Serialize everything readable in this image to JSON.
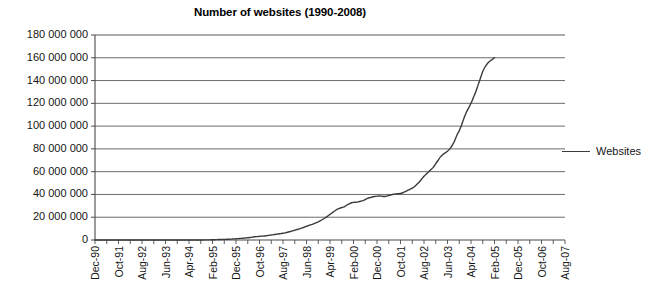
{
  "chart": {
    "title": "Number of websites (1990-2008)",
    "legend_label": "Websites",
    "legend_position": "right"
  },
  "chart_data": {
    "type": "line",
    "title": "Number of websites (1990-2008)",
    "xlabel": "",
    "ylabel": "",
    "ylim": [
      0,
      180000000
    ],
    "ytick_values": [
      0,
      20000000,
      40000000,
      60000000,
      80000000,
      100000000,
      120000000,
      140000000,
      160000000,
      180000000
    ],
    "ytick_labels": [
      "0",
      "20 000 000",
      "40 000 000",
      "60 000 000",
      "80 000 000",
      "100 000 000",
      "120 000 000",
      "140 000 000",
      "160 000 000",
      "180 000 000"
    ],
    "grid": true,
    "xtick_labels": [
      "Dec-90",
      "Oct-91",
      "Aug-92",
      "Jun-93",
      "Apr-94",
      "Feb-95",
      "Dec-95",
      "Oct-96",
      "Aug-97",
      "Jun-98",
      "Apr-99",
      "Feb-00",
      "Dec-00",
      "Oct-01",
      "Aug-02",
      "Jun-03",
      "Apr-04",
      "Feb-05",
      "Dec-05",
      "Oct-06",
      "Aug-07"
    ],
    "series": [
      {
        "name": "Websites",
        "color": "#3b3b3b",
        "x": [
          "Dec-90",
          "Oct-91",
          "Aug-92",
          "Jun-93",
          "Apr-94",
          "Feb-95",
          "Dec-95",
          "Oct-96",
          "Aug-97",
          "Jun-98",
          "Apr-99",
          "Feb-00",
          "Dec-00",
          "Oct-01",
          "Aug-02",
          "Jun-03",
          "Apr-04",
          "Feb-05",
          "Dec-05",
          "Oct-06",
          "Aug-07",
          "Jun-08"
        ],
        "values": [
          0,
          0,
          0,
          0,
          100000,
          600000,
          1500000,
          3500000,
          6000000,
          9500000,
          14000000,
          21000000,
          28500000,
          34000000,
          38500000,
          40500000,
          47000000,
          60000000,
          75000000,
          96000000,
          130000000,
          160000000
        ]
      }
    ],
    "monthly_curve": [
      0,
      0,
      0,
      0,
      0,
      0,
      0,
      0,
      0,
      0,
      0,
      0,
      0,
      0,
      0,
      0,
      0,
      0,
      0,
      0,
      0,
      0,
      0,
      0,
      0,
      0,
      0,
      0,
      0,
      0,
      0,
      0,
      0,
      0,
      0,
      0,
      0,
      0,
      0,
      0,
      0,
      0,
      0,
      0,
      0,
      0,
      50000,
      80000,
      100000,
      150000,
      200000,
      280000,
      350000,
      420000,
      500000,
      560000,
      620000,
      700000,
      800000,
      950000,
      1100000,
      1250000,
      1400000,
      1550000,
      1750000,
      1950000,
      2200000,
      2500000,
      2800000,
      3000000,
      3200000,
      3400000,
      3500000,
      3800000,
      4100000,
      4400000,
      4700000,
      5000000,
      5300000,
      5600000,
      5900000,
      6300000,
      6800000,
      7400000,
      8000000,
      8600000,
      9200000,
      9800000,
      10500000,
      11200000,
      12000000,
      12800000,
      13500000,
      14200000,
      15000000,
      16000000,
      17000000,
      18200000,
      19500000,
      21000000,
      22500000,
      24000000,
      25500000,
      26800000,
      27800000,
      28500000,
      29000000,
      30500000,
      31500000,
      32500000,
      33000000,
      33200000,
      33500000,
      34000000,
      34500000,
      35500000,
      36500000,
      37200000,
      37800000,
      38200000,
      38500000,
      38700000,
      38500000,
      38200000,
      38500000,
      39000000,
      39600000,
      40200000,
      40500000,
      40600000,
      40800000,
      41500000,
      42500000,
      43500000,
      44500000,
      45500000,
      47000000,
      49000000,
      51000000,
      53500000,
      56000000,
      58000000,
      60000000,
      62000000,
      64000000,
      67000000,
      70000000,
      73000000,
      75000000,
      76500000,
      78000000,
      80000000,
      83000000,
      87000000,
      92000000,
      96000000,
      101000000,
      107000000,
      112000000,
      116000000,
      120000000,
      125000000,
      130000000,
      136000000,
      142000000,
      148000000,
      152000000,
      155000000,
      157000000,
      158500000,
      160000000
    ],
    "monthly_start": "Dec-90",
    "annotations": []
  }
}
